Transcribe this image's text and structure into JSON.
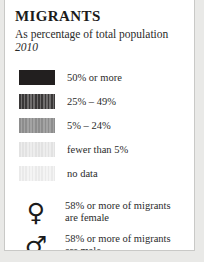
{
  "panel": {
    "title": "MIGRANTS",
    "subtitle": "As percentage of total population",
    "year": "2010"
  },
  "chart_data": {
    "type": "table",
    "title": "MIGRANTS",
    "subtitle": "As percentage of total population",
    "year": "2010",
    "legend_position": "panel",
    "categories": [
      "50% or more",
      "25% – 49%",
      "5% – 24%",
      "fewer than 5%",
      "no data"
    ],
    "swatch_colors": [
      "#221f1f",
      "#4f4d4d",
      "#969696",
      "#e7e7e7",
      "#efefef"
    ],
    "swatch_patterns": [
      "solid",
      "vertical-stripes",
      "vertical-stripes",
      "vertical-stripes",
      "vertical-stripes"
    ],
    "annotations": [
      {
        "symbol": "venus",
        "glyph": "♀",
        "line1": "58% or more of migrants",
        "line2": "are female",
        "threshold": 58
      },
      {
        "symbol": "mars",
        "glyph": "♂",
        "line1": "58% or more of migrants",
        "line2": "are male",
        "threshold": 58
      }
    ]
  },
  "legend": {
    "items": [
      {
        "label": "50% or more"
      },
      {
        "label": "25% – 49%"
      },
      {
        "label": "5% – 24%"
      },
      {
        "label": "fewer than 5%"
      },
      {
        "label": "no data"
      }
    ]
  },
  "gender": {
    "items": [
      {
        "glyph": "♀",
        "line1": "58% or more of migrants",
        "line2": "are female"
      },
      {
        "glyph": "♂",
        "line1": "58% or more of migrants",
        "line2": "are male"
      }
    ]
  }
}
